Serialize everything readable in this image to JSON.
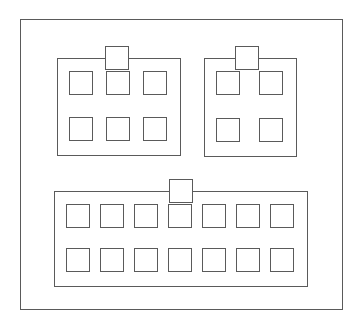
{
  "diagram": {
    "type": "block-diagram",
    "background_color": "#ffffff",
    "line_color": "#5a5a5a",
    "fill_color": "#ffffff",
    "line_width_px": 1,
    "outer_frame": {
      "name": "outer-frame",
      "x": 20,
      "y": 19,
      "width": 323,
      "height": 291
    },
    "groups": [
      {
        "id": "group-a",
        "position": "top-left",
        "x": 56,
        "y": 57,
        "width": 124,
        "height": 98,
        "tab": {
          "x": 104,
          "y": 45,
          "width": 24,
          "height": 24,
          "position": "top-center"
        },
        "grid": {
          "columns": 3,
          "rows": 2,
          "cell_count": 6,
          "cell_size": 24
        }
      },
      {
        "id": "group-b",
        "position": "top-right",
        "x": 203,
        "y": 57,
        "width": 93,
        "height": 99,
        "tab": {
          "x": 234,
          "y": 45,
          "width": 24,
          "height": 24,
          "position": "top-center"
        },
        "grid": {
          "columns": 2,
          "rows": 2,
          "cell_count": 4,
          "cell_size": 24
        }
      },
      {
        "id": "group-c",
        "position": "bottom-wide",
        "x": 53,
        "y": 190,
        "width": 254,
        "height": 96,
        "tab": {
          "x": 168,
          "y": 178,
          "width": 24,
          "height": 24,
          "position": "top-center"
        },
        "grid": {
          "columns": 7,
          "rows": 2,
          "cell_count": 14,
          "cell_size": 24
        }
      }
    ],
    "caption": ""
  }
}
